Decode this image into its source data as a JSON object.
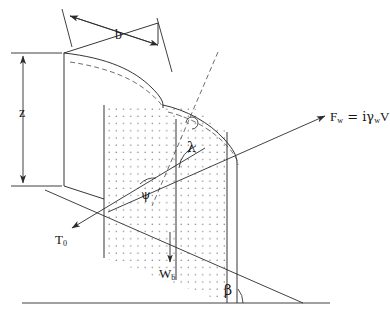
{
  "figure": {
    "kind": "engineering-line-diagram",
    "background_color": "#ffffff",
    "line_color": "#2b2b2b",
    "dash_color": "#4a4a4a",
    "stipple_color": "#5a5a5a"
  },
  "labels": {
    "width_dimension": "b",
    "height_dimension": "z",
    "water_force": "F",
    "water_force_sub": "w",
    "water_force_rest": " = iγ",
    "water_force_rest_sub": "w",
    "water_force_tail": "V",
    "water_force_full": "F_w = iγ_w V",
    "toe_force": "T",
    "toe_force_sub": "0",
    "block_weight": "W",
    "block_weight_sub": "b",
    "angle_lambda": "λ",
    "angle_psi": "ψ",
    "angle_beta": "β"
  },
  "caption": {
    "text": "",
    "note": "caption clipped by bottom image edge — only faint letter tops visible"
  },
  "arrows": [
    {
      "name": "water-force-arrow",
      "label": "F_w = iγ_w V",
      "direction": "up-right"
    },
    {
      "name": "toe-force-arrow",
      "label": "T_0",
      "direction": "down-left"
    },
    {
      "name": "block-weight-arrow",
      "label": "W_b",
      "direction": "down"
    },
    {
      "name": "width-dimension-arrow",
      "label": "b",
      "direction": "double-headed-diagonal"
    },
    {
      "name": "height-dimension-arrow",
      "label": "z",
      "direction": "double-headed-vertical"
    }
  ]
}
